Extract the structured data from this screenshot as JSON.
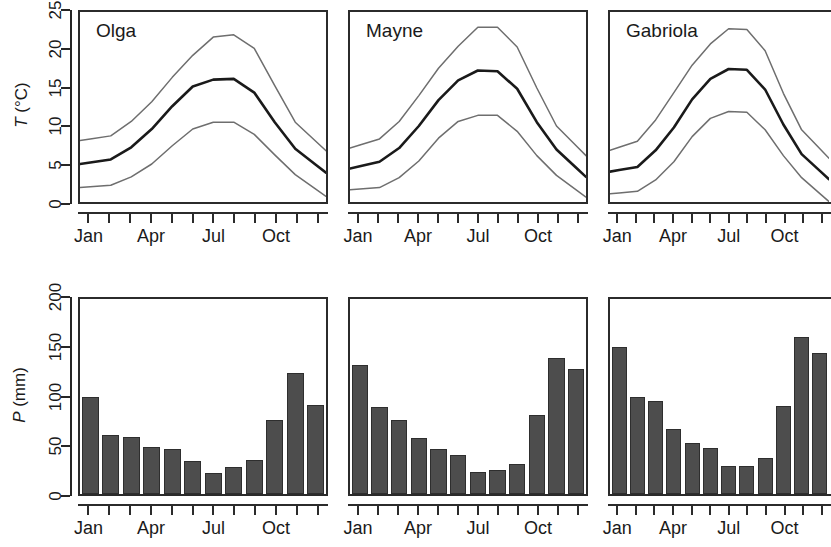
{
  "figure": {
    "kind": "climate-diagram-panel-grid",
    "panels_per_row": 3
  },
  "temperature_row": {
    "ylabel": "T (°C)",
    "ylabel_symbol": "T",
    "ylabel_unit": "(°C)",
    "yticks": [
      "0",
      "5",
      "10",
      "15",
      "20",
      "25"
    ],
    "ymin": 0,
    "ymax": 25
  },
  "precipitation_row": {
    "ylabel": "P (mm)",
    "ylabel_symbol": "P",
    "ylabel_unit": "(mm)",
    "yticks": [
      "0",
      "50",
      "100",
      "150",
      "200"
    ],
    "ymin": 0,
    "ymax": 200
  },
  "xaxis": {
    "tick_count": 12,
    "labels": [
      "Jan",
      "Apr",
      "Jul",
      "Oct"
    ],
    "label_months": [
      1,
      4,
      7,
      10
    ],
    "months": [
      "Jan",
      "Feb",
      "Mar",
      "Apr",
      "May",
      "Jun",
      "Jul",
      "Aug",
      "Sep",
      "Oct",
      "Nov",
      "Dec"
    ]
  },
  "colors": {
    "bar_fill": "#4d4d4d",
    "bar_edge": "#2e2e2e",
    "mean_line": "#1a1a1a",
    "envelope_line": "#6e6e6e",
    "frame": "#2b2b2b",
    "background": "#ffffff"
  },
  "site_names": [
    "Olga",
    "Mayne",
    "Gabriola"
  ],
  "chart_data": [
    {
      "type": "line",
      "title": "Olga",
      "panel": "temperature",
      "xlabel": "",
      "ylabel": "T (°C)",
      "ylim": [
        0,
        25
      ],
      "grid": false,
      "legend": "none",
      "x": [
        "Jan",
        "Feb",
        "Mar",
        "Apr",
        "May",
        "Jun",
        "Jul",
        "Aug",
        "Sep",
        "Oct",
        "Nov",
        "Dec"
      ],
      "series": [
        {
          "name": "max",
          "values": [
            8.3,
            8.7,
            10.6,
            13.2,
            16.4,
            19.3,
            21.7,
            22.0,
            20.2,
            15.3,
            10.5,
            8.0
          ]
        },
        {
          "name": "mean",
          "values": [
            5.2,
            5.6,
            7.2,
            9.6,
            12.6,
            15.2,
            16.1,
            16.2,
            14.4,
            10.5,
            7.0,
            4.9
          ]
        },
        {
          "name": "min",
          "values": [
            2.0,
            2.2,
            3.3,
            5.0,
            7.4,
            9.6,
            10.5,
            10.5,
            8.9,
            6.2,
            3.6,
            1.7
          ]
        }
      ]
    },
    {
      "type": "line",
      "title": "Mayne",
      "panel": "temperature",
      "xlabel": "",
      "ylabel": "T (°C)",
      "ylim": [
        0,
        25
      ],
      "grid": false,
      "legend": "none",
      "x": [
        "Jan",
        "Feb",
        "Mar",
        "Apr",
        "May",
        "Jun",
        "Jul",
        "Aug",
        "Sep",
        "Oct",
        "Nov",
        "Dec"
      ],
      "series": [
        {
          "name": "max",
          "values": [
            7.5,
            8.3,
            10.6,
            14.0,
            17.6,
            20.5,
            23.0,
            23.0,
            20.4,
            15.0,
            10.0,
            7.4
          ]
        },
        {
          "name": "mean",
          "values": [
            4.7,
            5.3,
            7.1,
            10.0,
            13.4,
            16.0,
            17.3,
            17.2,
            14.9,
            10.5,
            6.9,
            4.5
          ]
        },
        {
          "name": "min",
          "values": [
            1.7,
            1.9,
            3.2,
            5.4,
            8.4,
            10.6,
            11.4,
            11.4,
            9.3,
            6.1,
            3.5,
            1.6
          ]
        }
      ]
    },
    {
      "type": "line",
      "title": "Gabriola",
      "panel": "temperature",
      "xlabel": "",
      "ylabel": "T (°C)",
      "ylim": [
        0,
        25
      ],
      "grid": false,
      "legend": "none",
      "x": [
        "Jan",
        "Feb",
        "Mar",
        "Apr",
        "May",
        "Jun",
        "Jul",
        "Aug",
        "Sep",
        "Oct",
        "Nov",
        "Dec"
      ],
      "series": [
        {
          "name": "max",
          "values": [
            7.2,
            8.0,
            10.8,
            14.4,
            18.0,
            20.8,
            22.8,
            22.7,
            19.9,
            14.3,
            9.5,
            7.0
          ]
        },
        {
          "name": "mean",
          "values": [
            4.2,
            4.6,
            6.8,
            9.8,
            13.5,
            16.2,
            17.5,
            17.4,
            14.8,
            10.2,
            6.3,
            4.1
          ]
        },
        {
          "name": "min",
          "values": [
            1.2,
            1.4,
            2.9,
            5.3,
            8.6,
            11.0,
            11.9,
            11.8,
            9.5,
            6.1,
            3.2,
            1.1
          ]
        }
      ]
    },
    {
      "type": "bar",
      "title": "Olga",
      "panel": "precipitation",
      "xlabel": "",
      "ylabel": "P (mm)",
      "ylim": [
        0,
        200
      ],
      "grid": false,
      "legend": "none",
      "categories": [
        "Jan",
        "Feb",
        "Mar",
        "Apr",
        "May",
        "Jun",
        "Jul",
        "Aug",
        "Sep",
        "Oct",
        "Nov",
        "Dec"
      ],
      "values": [
        99,
        61,
        58,
        48,
        46,
        34,
        22,
        28,
        35,
        76,
        124,
        91
      ]
    },
    {
      "type": "bar",
      "title": "Mayne",
      "panel": "precipitation",
      "xlabel": "",
      "ylabel": "P (mm)",
      "ylim": [
        0,
        200
      ],
      "grid": false,
      "legend": "none",
      "categories": [
        "Jan",
        "Feb",
        "Mar",
        "Apr",
        "May",
        "Jun",
        "Jul",
        "Aug",
        "Sep",
        "Oct",
        "Nov",
        "Dec"
      ],
      "values": [
        132,
        89,
        76,
        57,
        46,
        40,
        23,
        25,
        31,
        81,
        139,
        128
      ]
    },
    {
      "type": "bar",
      "title": "Gabriola",
      "panel": "precipitation",
      "xlabel": "",
      "ylabel": "P (mm)",
      "ylim": [
        0,
        200
      ],
      "grid": false,
      "legend": "none",
      "categories": [
        "Jan",
        "Feb",
        "Mar",
        "Apr",
        "May",
        "Jun",
        "Jul",
        "Aug",
        "Sep",
        "Oct",
        "Nov",
        "Dec"
      ],
      "values": [
        151,
        99,
        95,
        67,
        52,
        47,
        29,
        29,
        37,
        90,
        161,
        145
      ]
    }
  ]
}
